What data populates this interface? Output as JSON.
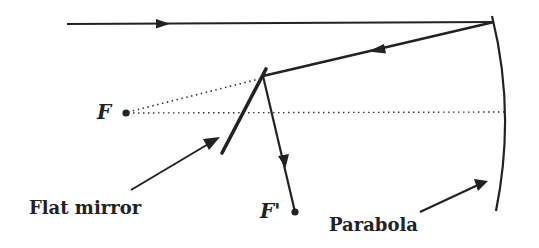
{
  "diagram": {
    "colors": {
      "ink": "#222222",
      "background": "#ffffff"
    },
    "labels": {
      "focus_primary": "F",
      "focus_secondary": "F'",
      "flat_mirror": "Flat mirror",
      "parabola": "Parabola"
    },
    "elements": [
      {
        "id": "incoming-ray",
        "type": "ray",
        "from": [
          67,
          24
        ],
        "to": [
          494,
          22
        ],
        "arrow": "right"
      },
      {
        "id": "reflected-ray",
        "type": "ray",
        "from": [
          494,
          22
        ],
        "to": [
          263,
          76
        ],
        "arrow": "left"
      },
      {
        "id": "diverted-ray",
        "type": "ray",
        "from": [
          263,
          76
        ],
        "to": [
          295,
          212
        ],
        "arrow": "down"
      },
      {
        "id": "flat-mirror",
        "type": "mirror",
        "from": [
          266,
          69
        ],
        "to": [
          222,
          153
        ]
      },
      {
        "id": "parabola",
        "type": "curve",
        "top": [
          494,
          18
        ],
        "vertex": [
          507,
          112
        ],
        "bottom": [
          497,
          210
        ]
      },
      {
        "id": "virtual-ray",
        "type": "dotted",
        "from": [
          126,
          113
        ],
        "to": [
          263,
          78
        ]
      },
      {
        "id": "optical-axis",
        "type": "dotted",
        "from": [
          126,
          113
        ],
        "to": [
          507,
          112
        ]
      },
      {
        "id": "focus-point-F",
        "type": "point",
        "at": [
          126,
          113
        ]
      },
      {
        "id": "focus-point-F-prime",
        "type": "point",
        "at": [
          295,
          212
        ]
      }
    ]
  }
}
